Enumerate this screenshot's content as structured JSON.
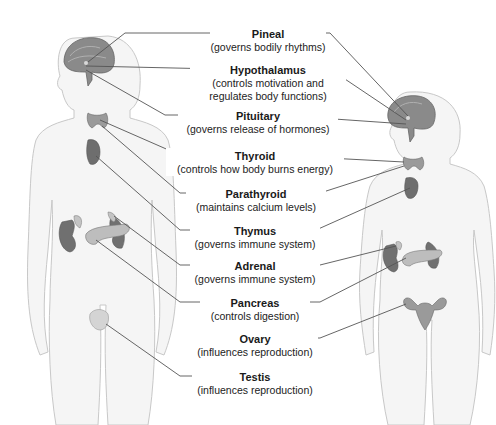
{
  "diagram": {
    "type": "anatomical-labeled-illustration",
    "figures": [
      "male",
      "female"
    ],
    "colors": {
      "leader_line": "#555555",
      "gland_dark": "#6b6b6b",
      "gland_light": "#b5b5b5",
      "body_outline": "#c8c8c8",
      "body_fill": "#f4f4f4"
    }
  },
  "labels": [
    {
      "name": "Pineal",
      "desc": "(governs bodily rhythms)"
    },
    {
      "name": "Hypothalamus",
      "desc": "(controls motivation and",
      "desc2": "regulates body functions)"
    },
    {
      "name": "Pituitary",
      "desc": "(governs release of hormones)"
    },
    {
      "name": "Thyroid",
      "desc": "(controls how body burns energy)"
    },
    {
      "name": "Parathyroid",
      "desc": "(maintains calcium levels)"
    },
    {
      "name": "Thymus",
      "desc": "(governs immune system)"
    },
    {
      "name": "Adrenal",
      "desc": "(governs immune system)"
    },
    {
      "name": "Pancreas",
      "desc": "(controls digestion)"
    },
    {
      "name": "Ovary",
      "desc": "(influences reproduction)"
    },
    {
      "name": "Testis",
      "desc": "(influences reproduction)"
    }
  ]
}
